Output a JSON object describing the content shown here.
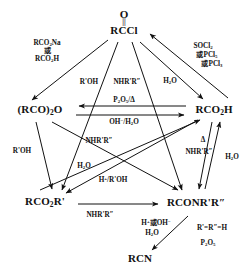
{
  "diagram": {
    "type": "reaction-scheme",
    "nodes": [
      {
        "id": "acyl_chloride",
        "label": "RCCl",
        "above": "O",
        "bond": "||",
        "x": 124,
        "y": 30
      },
      {
        "id": "anhydride",
        "label": "(RCO)₂O",
        "x": 40,
        "y": 110
      },
      {
        "id": "carboxylic_acid",
        "label": "RCO₂H",
        "x": 214,
        "y": 110
      },
      {
        "id": "ester",
        "label": "RCO₂R'",
        "x": 45,
        "y": 202
      },
      {
        "id": "amide",
        "label": "RCONR'R″",
        "x": 196,
        "y": 202
      },
      {
        "id": "nitrile",
        "label": "RCN",
        "x": 140,
        "y": 258
      }
    ],
    "labels": [
      {
        "id": "rco2na",
        "text": "RCO₂Na",
        "x": 47,
        "y": 43
      },
      {
        "id": "huo1",
        "text": "或",
        "x": 47,
        "y": 51
      },
      {
        "id": "rco2h",
        "text": "RCO₂H",
        "x": 47,
        "y": 59
      },
      {
        "id": "socl2",
        "text": "SOCl₂",
        "x": 203,
        "y": 46
      },
      {
        "id": "pcl5",
        "text": "或PCl₅",
        "x": 207,
        "y": 55
      },
      {
        "id": "pcl3",
        "text": "或PCl₃",
        "x": 212,
        "y": 64
      },
      {
        "id": "rroh_top",
        "text": "R'OH",
        "x": 89,
        "y": 82
      },
      {
        "id": "nhrr_top",
        "text": "NHR'R″",
        "x": 127,
        "y": 82
      },
      {
        "id": "h2o_top",
        "text": "H₂O",
        "x": 170,
        "y": 81
      },
      {
        "id": "p2o5",
        "text": "P₂O₅/Δ",
        "x": 124,
        "y": 100
      },
      {
        "id": "oh_h2o",
        "text": "OH⁻/H₂O",
        "x": 124,
        "y": 122
      },
      {
        "id": "nhrr_mid",
        "text": "NHR'R″",
        "x": 99,
        "y": 141
      },
      {
        "id": "delta",
        "text": "Δ",
        "x": 203,
        "y": 140
      },
      {
        "id": "nhrr_right",
        "text": "NHR'R″",
        "x": 199,
        "y": 152
      },
      {
        "id": "rroh_left",
        "text": "R'OH",
        "x": 22,
        "y": 151
      },
      {
        "id": "h2o_right",
        "text": "H₂O",
        "x": 232,
        "y": 157
      },
      {
        "id": "h2o_mid",
        "text": "H₂O",
        "x": 84,
        "y": 166
      },
      {
        "id": "h_rroh",
        "text": "H⁺/R'OH",
        "x": 113,
        "y": 180
      },
      {
        "id": "nhrr_bottom",
        "text": "NHR'R″",
        "x": 100,
        "y": 215
      },
      {
        "id": "h_oh",
        "text": "H⁺或OH⁻",
        "x": 156,
        "y": 223
      },
      {
        "id": "h2o_bottom",
        "text": "H₂O",
        "x": 152,
        "y": 233
      },
      {
        "id": "r_eq_h",
        "text": "R'=R″=H",
        "x": 212,
        "y": 228
      },
      {
        "id": "p2o5_bottom",
        "text": "P₂O₅",
        "x": 208,
        "y": 243
      }
    ]
  }
}
